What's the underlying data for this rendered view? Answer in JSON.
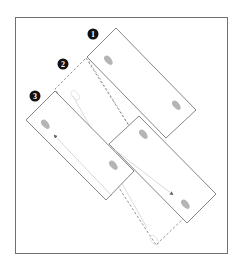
{
  "diagram": {
    "type": "sequence-of-positions",
    "colors": {
      "frame": "#707070",
      "panel_stroke": "#666666",
      "dashed_stroke": "#777777",
      "footprint": "#b5b5b5",
      "ghost_footprint": "#dedede",
      "marker_fill": "#111111",
      "arrow": "#c8c8c8"
    },
    "markers": [
      {
        "label": "1",
        "x": 93,
        "y": 34
      },
      {
        "label": "2",
        "x": 63,
        "y": 64
      },
      {
        "label": "3",
        "x": 35,
        "y": 96
      }
    ],
    "panels": [
      {
        "id": "panel-1",
        "style": "solid",
        "points": "116,28 196,110 166,138 87,57"
      },
      {
        "id": "panel-2",
        "style": "dashed",
        "points": "86,58 186,216 156,245 55,89"
      },
      {
        "id": "panel-3",
        "style": "solid",
        "points": "55,91 134,171 106,200 26,120"
      },
      {
        "id": "panel-4",
        "style": "solid",
        "points": "139,116 216,194 187,223 109,144"
      }
    ]
  }
}
